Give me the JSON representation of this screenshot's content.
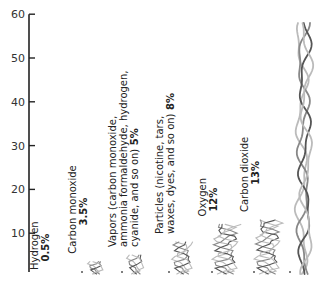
{
  "chart_data": {
    "type": "bar",
    "title": "",
    "xlabel": "",
    "ylabel": "",
    "ylim": [
      0,
      60
    ],
    "yticks": [
      10,
      20,
      30,
      40,
      50,
      60
    ],
    "grid": false,
    "categories": [
      {
        "lines": [
          "Hydrogen"
        ],
        "pct_label": "0.5%",
        "value": 0.5
      },
      {
        "lines": [
          "Carbon monoxide"
        ],
        "pct_label": "3.5%",
        "value": 3.5
      },
      {
        "lines": [
          "Vapors (carbon monoxide,",
          "ammonia formaldehyde, hydrogen,",
          "cyanide, and so on)"
        ],
        "pct_label": "5%",
        "value": 5
      },
      {
        "lines": [
          "Particles (nicotine, tars,",
          "waxes, dyes, and so on)"
        ],
        "pct_label": "8%",
        "value": 8
      },
      {
        "lines": [
          "Oxygen"
        ],
        "pct_label": "12%",
        "value": 12
      },
      {
        "lines": [
          "Carbon dioxide"
        ],
        "pct_label": "13%",
        "value": 13
      },
      {
        "lines": [],
        "pct_label": "",
        "value": 58
      }
    ],
    "colors": {
      "axis": "#222222",
      "smoke_dark": "#555555",
      "smoke_mid": "#888888",
      "smoke_light": "#bbbbbb"
    }
  }
}
